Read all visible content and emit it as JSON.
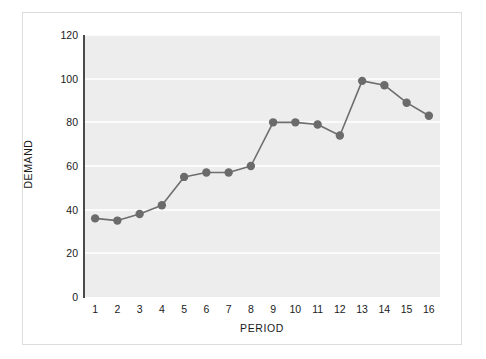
{
  "chart_data": {
    "type": "line",
    "title": "",
    "xlabel": "PERIOD",
    "ylabel": "DEMAND",
    "x": [
      1,
      2,
      3,
      4,
      5,
      6,
      7,
      8,
      9,
      10,
      11,
      12,
      13,
      14,
      15,
      16
    ],
    "values": [
      36,
      35,
      38,
      42,
      55,
      57,
      57,
      60,
      80,
      80,
      79,
      74,
      99,
      97,
      89,
      83
    ],
    "series": [
      {
        "name": "Demand",
        "values": [
          36,
          35,
          38,
          42,
          55,
          57,
          57,
          60,
          80,
          80,
          79,
          74,
          99,
          97,
          89,
          83
        ]
      }
    ],
    "xtick_labels": [
      "1",
      "2",
      "3",
      "4",
      "5",
      "6",
      "7",
      "8",
      "9",
      "10",
      "11",
      "12",
      "13",
      "14",
      "15",
      "16"
    ],
    "ytick_labels": [
      "0",
      "20",
      "40",
      "60",
      "80",
      "100",
      "120"
    ],
    "yticks": [
      0,
      20,
      40,
      60,
      80,
      100,
      120
    ],
    "ylim": [
      0,
      120
    ],
    "xlim": [
      0.5,
      16.5
    ],
    "grid": "horizontal",
    "legend": "none",
    "marker": "circle",
    "colors": {
      "line": "#6e6e6e",
      "marker": "#6b6b6b",
      "plot_background": "#ededed",
      "gridline": "#fbfbfb",
      "axis": "#4a4a4a",
      "text": "#1a1a1a",
      "card_background": "#ffffff",
      "card_border": "#dcdcdc"
    }
  }
}
